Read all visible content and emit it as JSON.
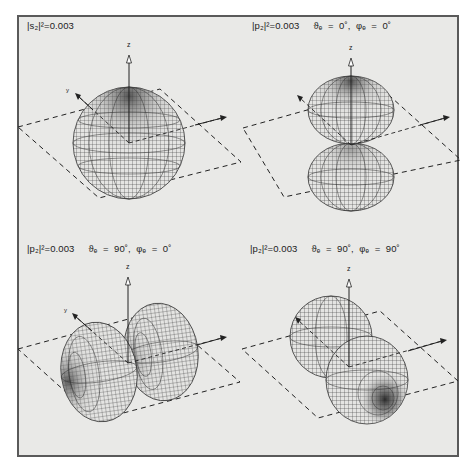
{
  "figure": {
    "background": "#e9e9e7",
    "frame_color": "#5a5a5a",
    "line_color": "#222222",
    "panels": [
      {
        "id": "s",
        "label": "|s₂|²=0.003",
        "angles": "",
        "axis_z_label": "z",
        "axis_y_label": "y",
        "axis_x_label": "x",
        "shape": "sphere"
      },
      {
        "id": "pz",
        "label": "|p₂|²=0.003",
        "angles": "ϑₑ  =  0˚,  φₑ  =  0˚",
        "axis_z_label": "z",
        "axis_y_label": "y",
        "axis_x_label": "x",
        "shape": "two lobes along z"
      },
      {
        "id": "px",
        "label": "|p₂|²=0.003",
        "angles": "ϑₑ  =  90˚,  φₑ  =  0˚",
        "axis_z_label": "z",
        "axis_y_label": "y",
        "axis_x_label": "x",
        "shape": "two lobes along x"
      },
      {
        "id": "py",
        "label": "|p₂|²=0.003",
        "angles": "ϑₑ  =  90˚,  φₑ  =  90˚",
        "axis_z_label": "z",
        "axis_y_label": "y",
        "axis_x_label": "x",
        "shape": "two lobes along y"
      }
    ]
  }
}
